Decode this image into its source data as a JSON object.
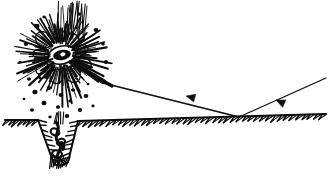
{
  "figure": {
    "style": "black-and-white pen-and-ink line drawing",
    "background_color": "#ffffff",
    "ink_color": "#0d0d0d",
    "width": 330,
    "height": 181,
    "caption": ""
  },
  "scene": {
    "ground": {
      "name": "ground-line",
      "description": "horizontal terrain line with short diagonal hatch ticks below it",
      "left_segment": {
        "x1": 5,
        "y1": 120,
        "x2": 38,
        "y2": 120
      },
      "right_segment": {
        "x1": 78,
        "y1": 121,
        "x2": 326,
        "y2": 114
      },
      "hatch_count_left": 7,
      "hatch_count_right": 42,
      "hatch_length": 7,
      "hatch_angle_deg": 55
    },
    "crater": {
      "name": "impact-crater",
      "description": "V-shaped pit below ground between the ground segments, walls hatched inward",
      "left_rim_x": 38,
      "right_rim_x": 78,
      "rim_y": 120,
      "bottom_x": 60,
      "bottom_y": 168,
      "hatch_count": 16
    },
    "crater_object": {
      "name": "crater-debris-object",
      "description": "dark knotted root-like mass resting inside the crater",
      "center_x": 58,
      "center_y": 140
    },
    "explosion": {
      "name": "explosion-burst",
      "description": "radial starburst of ink rays with a dark eye-shaped core",
      "center_x": 62,
      "center_y": 55,
      "core_rx": 9,
      "core_ry": 5,
      "inner_radius": 13,
      "outer_radius": 50,
      "ray_count": 64,
      "puff_lobes": 9
    },
    "debris": {
      "name": "debris-field",
      "description": "scattered round ink blobs thrown up and falling around the explosion",
      "dots": [
        {
          "x": 37,
          "y": 26,
          "r": 2.6
        },
        {
          "x": 44,
          "y": 17,
          "r": 1.6
        },
        {
          "x": 79,
          "y": 14,
          "r": 2.0
        },
        {
          "x": 96,
          "y": 30,
          "r": 2.4
        },
        {
          "x": 103,
          "y": 44,
          "r": 1.8
        },
        {
          "x": 26,
          "y": 44,
          "r": 2.2
        },
        {
          "x": 20,
          "y": 62,
          "r": 1.5
        },
        {
          "x": 29,
          "y": 79,
          "r": 2.0
        },
        {
          "x": 106,
          "y": 62,
          "r": 2.2
        },
        {
          "x": 95,
          "y": 75,
          "r": 1.7
        },
        {
          "x": 35,
          "y": 92,
          "r": 2.6
        },
        {
          "x": 49,
          "y": 88,
          "r": 2.2
        },
        {
          "x": 61,
          "y": 95,
          "r": 2.4
        },
        {
          "x": 73,
          "y": 90,
          "r": 2.0
        },
        {
          "x": 86,
          "y": 96,
          "r": 2.3
        },
        {
          "x": 44,
          "y": 103,
          "r": 2.5
        },
        {
          "x": 58,
          "y": 107,
          "r": 2.1
        },
        {
          "x": 70,
          "y": 101,
          "r": 1.8
        },
        {
          "x": 80,
          "y": 110,
          "r": 2.2
        },
        {
          "x": 32,
          "y": 110,
          "r": 2.0
        },
        {
          "x": 93,
          "y": 106,
          "r": 1.6
        },
        {
          "x": 67,
          "y": 116,
          "r": 2.3
        },
        {
          "x": 50,
          "y": 117,
          "r": 1.7
        },
        {
          "x": 24,
          "y": 99,
          "r": 1.4
        },
        {
          "x": 88,
          "y": 84,
          "r": 1.5
        },
        {
          "x": 40,
          "y": 78,
          "r": 1.6
        }
      ]
    },
    "trajectory": {
      "name": "projectile-trajectory",
      "description": "incoming flight path descending from the upper right, bouncing at the impact point and continuing to the explosion",
      "segments": [
        {
          "name": "incoming-segment",
          "from": {
            "x": 326,
            "y": 78
          },
          "to": {
            "x": 239,
            "y": 117
          },
          "arrow_at": {
            "x": 276,
            "y": 100
          },
          "arrow_direction_deg": 204
        },
        {
          "name": "ricochet-segment",
          "from": {
            "x": 239,
            "y": 117
          },
          "to": {
            "x": 103,
            "y": 83
          },
          "arrow_at": {
            "x": 186,
            "y": 96
          },
          "arrow_direction_deg": 194
        },
        {
          "name": "burst-segment",
          "from": {
            "x": 103,
            "y": 83
          },
          "to": {
            "x": 70,
            "y": 62
          },
          "arrow_at": null,
          "arrow_direction_deg": null
        }
      ],
      "impact_point": {
        "x": 239,
        "y": 117
      },
      "arrow_head_length": 9,
      "arrow_head_width": 4
    }
  },
  "labels": {
    "explosion": "explosion",
    "crater": "crater",
    "trajectory": "trajectory",
    "ground": "ground"
  }
}
